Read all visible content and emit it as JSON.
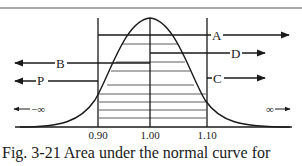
{
  "figure": {
    "caption": "Fig. 3-21 Area under the normal curve for",
    "ticks": [
      "0.90",
      "1.00",
      "1.10"
    ],
    "neg_inf": "←—∞",
    "pos_inf": "∞—→",
    "neg_inf_symbol": "−∞",
    "pos_inf_symbol": "∞",
    "regions": [
      {
        "label": "A",
        "from": "0.90",
        "to": "+∞",
        "direction": "right"
      },
      {
        "label": "D",
        "from": "1.00",
        "to": "+∞",
        "direction": "right"
      },
      {
        "label": "C",
        "from": "1.10",
        "to": "+∞",
        "direction": "right"
      },
      {
        "label": "B",
        "from": "1.00",
        "to": "−∞",
        "direction": "left"
      },
      {
        "label": "P",
        "from": "0.90",
        "to": "−∞",
        "direction": "left"
      }
    ],
    "colors": {
      "line": "#1a1a1a",
      "border": "#555555",
      "background": "#ffffff"
    }
  }
}
